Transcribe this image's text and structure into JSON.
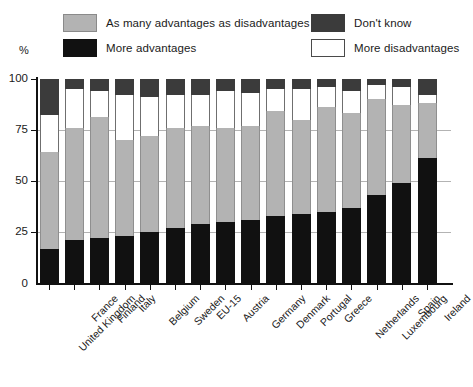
{
  "axis": {
    "y_label": "%",
    "y_ticks": [
      "100",
      "75",
      "50",
      "25",
      "0"
    ]
  },
  "legend": {
    "items": [
      {
        "label": "As many advantages as disadvantages",
        "swatch": "gray-swatch",
        "color": "#b3b3b3"
      },
      {
        "label": "More advantages",
        "swatch": "black-swatch",
        "color": "#111111"
      },
      {
        "label": "Don't know",
        "swatch": "dark-swatch",
        "color": "#3b3b3b"
      },
      {
        "label": "More disadvantages",
        "swatch": "white-swatch",
        "color": "#ffffff"
      }
    ]
  },
  "chart_data": {
    "type": "bar",
    "title": "",
    "xlabel": "",
    "ylabel": "%",
    "ylim": [
      0,
      100
    ],
    "grid": true,
    "stacked": true,
    "legend_position": "top",
    "categories": [
      "United Kingdom",
      "France",
      "Finland",
      "Italy",
      "Belgium",
      "Sweden",
      "EU-15",
      "Austria",
      "Germany",
      "Denmark",
      "Portugal",
      "Greece",
      "Netherlands",
      "Luxembourg",
      "Spain",
      "Ireland"
    ],
    "series": [
      {
        "name": "More advantages",
        "color": "#111111",
        "values": [
          17,
          21,
          22,
          23,
          25,
          27,
          29,
          30,
          31,
          33,
          34,
          35,
          37,
          43,
          49,
          61
        ]
      },
      {
        "name": "As many advantages as disadvantages",
        "color": "#b3b3b3",
        "values": [
          47,
          55,
          59,
          47,
          47,
          49,
          48,
          46,
          46,
          51,
          46,
          51,
          46,
          47,
          38,
          27
        ]
      },
      {
        "name": "More disadvantages",
        "color": "#ffffff",
        "values": [
          18,
          19,
          13,
          22,
          19,
          16,
          15,
          18,
          16,
          11,
          15,
          10,
          11,
          7,
          9,
          4
        ]
      },
      {
        "name": "Don't know",
        "color": "#3b3b3b",
        "values": [
          18,
          5,
          6,
          8,
          9,
          8,
          8,
          6,
          7,
          5,
          5,
          4,
          6,
          3,
          4,
          8
        ]
      }
    ]
  }
}
